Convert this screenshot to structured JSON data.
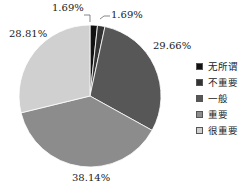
{
  "chart_data": {
    "type": "pie",
    "title": "",
    "categories": [
      "无所谓",
      "不重要",
      "一般",
      "重要",
      "很重要"
    ],
    "values": [
      1.69,
      1.69,
      29.66,
      38.14,
      28.81
    ],
    "labels": [
      "1.69%",
      "1.69%",
      "29.66%",
      "38.14%",
      "28.81%"
    ],
    "colors": [
      "#111111",
      "#333333",
      "#575757",
      "#8c8c8c",
      "#d0d0d0"
    ],
    "start_angle": "12 o'clock",
    "direction": "clockwise",
    "legend_position": "right"
  },
  "legend": [
    {
      "label": "无所谓",
      "color": "#111111"
    },
    {
      "label": "不重要",
      "color": "#333333"
    },
    {
      "label": "一般",
      "color": "#575757"
    },
    {
      "label": "重要",
      "color": "#8c8c8c"
    },
    {
      "label": "很重要",
      "color": "#d0d0d0"
    }
  ],
  "slice_labels": [
    "1.69%",
    "1.69%",
    "29.66%",
    "38.14%",
    "28.81%"
  ]
}
